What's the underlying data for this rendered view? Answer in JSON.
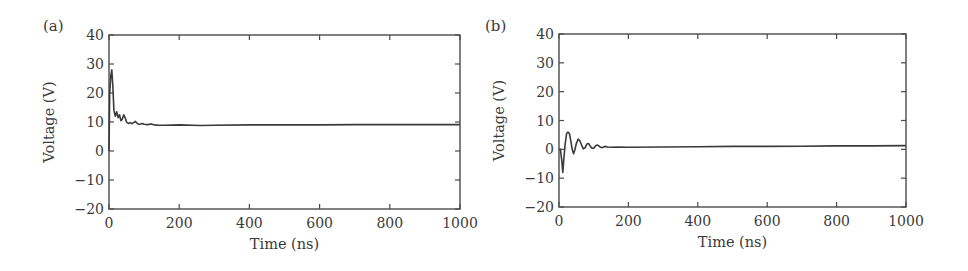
{
  "_note": "Waveform x/y arrays in chart_data are an approximate visual reconstruction read by eye from the screenshot, including interpolated points; they are not extracted source data. Settled levels and peak/dip magnitudes are more reliable than the timing/shape of individual ringing oscillations.",
  "chart_data": [
    {
      "panel": "(a)",
      "type": "line",
      "title": "",
      "xlabel": "Time (ns)",
      "ylabel": "Voltage (V)",
      "xlim": [
        0,
        1000
      ],
      "ylim": [
        -20,
        40
      ],
      "xticks": [
        0,
        200,
        400,
        600,
        800,
        1000
      ],
      "yticks": [
        -20,
        -10,
        0,
        10,
        20,
        30,
        40
      ],
      "grid": false,
      "legend": null,
      "data_quality": "approximate-visual-estimate",
      "series": [
        {
          "name": "voltage",
          "color": "#3a3a3a",
          "x": [
            0,
            2,
            5,
            8,
            11,
            14,
            18,
            22,
            26,
            30,
            34,
            38,
            42,
            46,
            50,
            55,
            60,
            65,
            70,
            75,
            80,
            85,
            90,
            95,
            100,
            110,
            120,
            130,
            140,
            160,
            200,
            260,
            300,
            400,
            500,
            600,
            700,
            800,
            900,
            1000
          ],
          "y": [
            0,
            20,
            26,
            28,
            22,
            14,
            12,
            13.5,
            11.5,
            12.5,
            10.5,
            11,
            12.5,
            11.5,
            10,
            9.5,
            9.8,
            9.4,
            9.8,
            10.2,
            9.6,
            9.2,
            9.3,
            9.5,
            9.2,
            9.1,
            9.3,
            9.0,
            8.9,
            8.9,
            9.0,
            8.8,
            8.9,
            9.0,
            9.0,
            9.0,
            9.1,
            9.1,
            9.1,
            9.1
          ]
        }
      ],
      "settled_value_estimate": 9,
      "peak_estimate": {
        "x": 8,
        "y": 28
      }
    },
    {
      "panel": "(b)",
      "type": "line",
      "title": "",
      "xlabel": "Time (ns)",
      "ylabel": "Voltage (V)",
      "xlim": [
        0,
        1000
      ],
      "ylim": [
        -20,
        40
      ],
      "xticks": [
        0,
        200,
        400,
        600,
        800,
        1000
      ],
      "yticks": [
        -20,
        -10,
        0,
        10,
        20,
        30,
        40
      ],
      "grid": false,
      "legend": null,
      "data_quality": "approximate-visual-estimate",
      "series": [
        {
          "name": "voltage",
          "color": "#3a3a3a",
          "x": [
            0,
            4,
            8,
            11,
            14,
            18,
            22,
            26,
            30,
            34,
            38,
            42,
            46,
            50,
            55,
            60,
            65,
            70,
            75,
            80,
            85,
            90,
            95,
            100,
            105,
            110,
            115,
            120,
            125,
            130,
            135,
            140,
            150,
            170,
            200,
            300,
            400,
            500,
            600,
            700,
            800,
            900,
            1000
          ],
          "y": [
            0,
            0,
            -4,
            -8,
            -3,
            2,
            5.5,
            6,
            5.5,
            3,
            0,
            -1.5,
            0,
            2,
            3.5,
            3,
            1.5,
            0.2,
            0.5,
            1.8,
            2,
            1.2,
            0.4,
            0.4,
            1.2,
            1.5,
            1.2,
            0.7,
            0.6,
            0.9,
            1.0,
            0.8,
            0.7,
            0.8,
            0.7,
            0.8,
            0.9,
            1.0,
            1.0,
            1.1,
            1.2,
            1.2,
            1.3
          ]
        }
      ],
      "settled_value_estimate": 1,
      "dip_estimate": {
        "x": 11,
        "y": -8
      },
      "peak_estimate": {
        "x": 26,
        "y": 6
      }
    }
  ],
  "panels": [
    {
      "id": "a",
      "label": "(a)",
      "xlabel": "Time (ns)",
      "ylabel": "Voltage (V)",
      "xtick_labels": [
        "0",
        "200",
        "400",
        "600",
        "800",
        "1000"
      ],
      "ytick_labels": [
        "−20",
        "−10",
        "0",
        "10",
        "20",
        "30",
        "40"
      ]
    },
    {
      "id": "b",
      "label": "(b)",
      "xlabel": "Time (ns)",
      "ylabel": "Voltage (V)",
      "xtick_labels": [
        "0",
        "200",
        "400",
        "600",
        "800",
        "1000"
      ],
      "ytick_labels": [
        "−20",
        "−10",
        "0",
        "10",
        "20",
        "30",
        "40"
      ]
    }
  ],
  "colors": {
    "axis": "#4a4a4a",
    "line": "#3a3a3a",
    "text": "#3a3a3a",
    "background": "#ffffff"
  }
}
